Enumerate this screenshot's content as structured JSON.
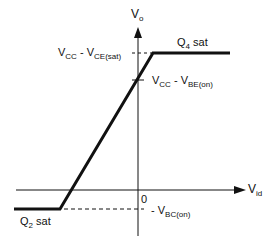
{
  "diagram": {
    "type": "transfer-characteristic",
    "axes": {
      "y_label": "V",
      "y_label_sub": "o",
      "x_label": "V",
      "x_label_sub": "id",
      "origin_label": "0"
    },
    "levels": {
      "top": {
        "main": "V",
        "sub1": "CC",
        "dash": " - V",
        "sub2": "CE(sat)"
      },
      "mid": {
        "main": "V",
        "sub1": "CC",
        "dash": " - V",
        "sub2": "BE(on)"
      },
      "bottom": {
        "prefix": "- V",
        "sub": "BC(on)"
      }
    },
    "regions": {
      "top": {
        "label": "Q",
        "sub": "4",
        "suffix": " sat"
      },
      "bottom": {
        "label": "Q",
        "sub": "2",
        "suffix": " sat"
      }
    },
    "colors": {
      "line": "#111111",
      "background": "#ffffff"
    }
  }
}
